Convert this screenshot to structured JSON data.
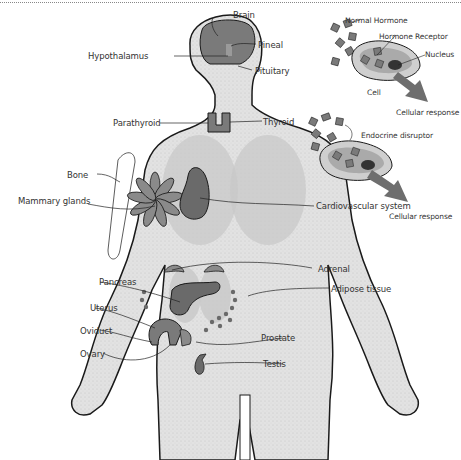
{
  "diagram": {
    "body_labels": {
      "brain": "Brain",
      "pineal": "Pineal",
      "hypothalamus": "Hypothalamus",
      "pituitary": "Pituitary",
      "parathyroid": "Parathyroid",
      "thyroid": "Thyroid",
      "bone": "Bone",
      "mammary_glands": "Mammary glands",
      "cardiovascular": "Cardiovascular system",
      "adrenal": "Adrenal",
      "pancreas": "Pancreas",
      "adipose": "Adipose tissue",
      "uterus": "Uterus",
      "oviduct": "Oviduct",
      "prostate": "Prostate",
      "ovary": "Ovary",
      "testis": "Testis"
    },
    "cell_panel_top": {
      "hormone": "Normal Hormone",
      "receptor": "Hormone Receptor",
      "nucleus": "Nucleus",
      "cell": "Cell",
      "response": "Cellular response"
    },
    "cell_panel_bottom": {
      "disruptor": "Endocrine disruptor",
      "response": "Cellular response"
    },
    "colors": {
      "body_fill": "#e4e4e4",
      "organ_fill": "#7a7a7a",
      "lung_fill": "#c8c8c8",
      "outline": "#1a1a1a",
      "arrow": "#6e6e6e"
    }
  }
}
